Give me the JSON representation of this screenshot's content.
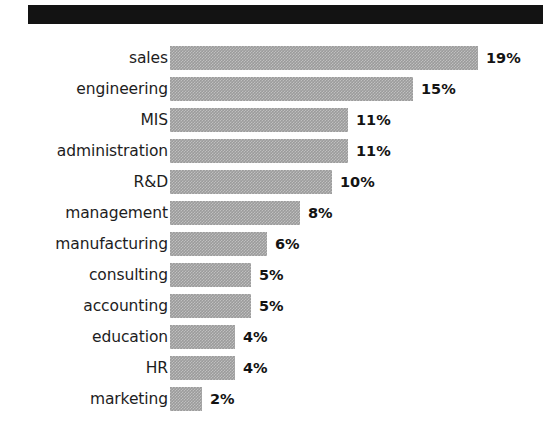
{
  "figure": {
    "background_color": "#ffffff",
    "header_rule_color": "#131313",
    "bar_color": "#9b9b9b",
    "text_color": "#1d1d1d",
    "value_text_color": "#131313"
  },
  "chart_data": {
    "type": "bar",
    "orientation": "horizontal",
    "title": "",
    "subtitle": "",
    "xlabel": "",
    "ylabel": "",
    "grid": false,
    "legend": null,
    "xlim": [
      0,
      19
    ],
    "value_suffix": "%",
    "categories": [
      "sales",
      "engineering",
      "MIS",
      "administration",
      "R&D",
      "management",
      "manufacturing",
      "consulting",
      "accounting",
      "education",
      "HR",
      "marketing"
    ],
    "values": [
      19,
      15,
      11,
      11,
      10,
      8,
      6,
      5,
      5,
      4,
      4,
      2
    ],
    "data_labels": [
      "19%",
      "15%",
      "11%",
      "11%",
      "10%",
      "8%",
      "6%",
      "5%",
      "5%",
      "4%",
      "4%",
      "2%"
    ]
  }
}
